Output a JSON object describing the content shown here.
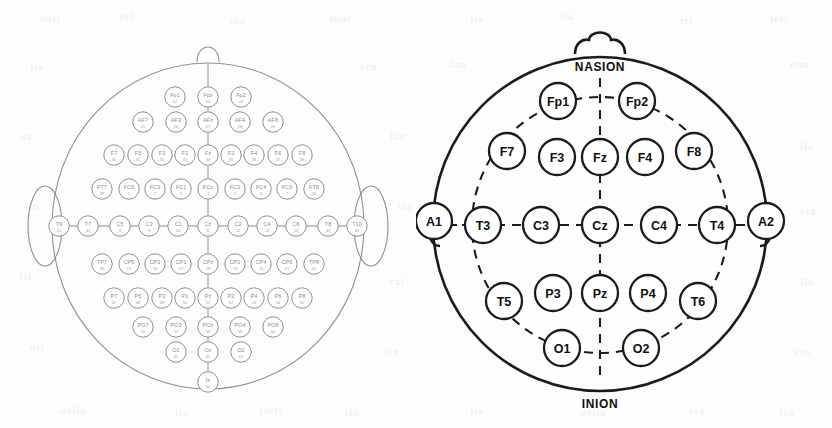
{
  "figure": {
    "background_color": "#fdfdfd",
    "hd_stroke_color": "#8d9095",
    "sd_stroke_color": "#1b1b1b"
  },
  "left_montage": {
    "name": "10-10 extended high-density EEG electrode map",
    "electrode_count": 64,
    "rows": [
      {
        "row_name": "Fp",
        "y": 97,
        "electrodes": [
          {
            "label": "Fp1",
            "num": "22",
            "x": 175
          },
          {
            "label": "Fpz",
            "num": "23",
            "x": 208
          },
          {
            "label": "Fp2",
            "num": "24",
            "x": 241
          }
        ]
      },
      {
        "row_name": "AF",
        "y": 122,
        "electrodes": [
          {
            "label": "AF7",
            "num": "25",
            "x": 143
          },
          {
            "label": "AF3",
            "num": "26",
            "x": 176
          },
          {
            "label": "AFz",
            "num": "27",
            "x": 208
          },
          {
            "label": "AF4",
            "num": "28",
            "x": 240
          },
          {
            "label": "AF8",
            "num": "29",
            "x": 273
          }
        ]
      },
      {
        "row_name": "F",
        "y": 155,
        "electrodes": [
          {
            "label": "F7",
            "num": "30",
            "x": 114
          },
          {
            "label": "F5",
            "num": "31",
            "x": 138
          },
          {
            "label": "F3",
            "num": "32",
            "x": 162
          },
          {
            "label": "F1",
            "num": "33",
            "x": 185
          },
          {
            "label": "Fz",
            "num": "34",
            "x": 208
          },
          {
            "label": "F2",
            "num": "35",
            "x": 231
          },
          {
            "label": "F4",
            "num": "36",
            "x": 254
          },
          {
            "label": "F6",
            "num": "37",
            "x": 278
          },
          {
            "label": "F8",
            "num": "38",
            "x": 302
          }
        ]
      },
      {
        "row_name": "FC",
        "y": 189,
        "electrodes": [
          {
            "label": "FT7",
            "num": "39",
            "x": 102
          },
          {
            "label": "FC5",
            "num": "1",
            "x": 129
          },
          {
            "label": "FC3",
            "num": "2",
            "x": 155
          },
          {
            "label": "FC1",
            "num": "3",
            "x": 181
          },
          {
            "label": "FCz",
            "num": "4",
            "x": 208
          },
          {
            "label": "FC2",
            "num": "5",
            "x": 235
          },
          {
            "label": "FC4",
            "num": "6",
            "x": 261
          },
          {
            "label": "FC6",
            "num": "7",
            "x": 287
          },
          {
            "label": "FT8",
            "num": "40",
            "x": 314
          }
        ]
      },
      {
        "row_name": "C",
        "y": 226,
        "electrodes": [
          {
            "label": "T9",
            "num": "42",
            "x": 59
          },
          {
            "label": "T7",
            "num": "41",
            "x": 88
          },
          {
            "label": "C5",
            "num": "8",
            "x": 120
          },
          {
            "label": "C3",
            "num": "9",
            "x": 149
          },
          {
            "label": "C1",
            "num": "10",
            "x": 178
          },
          {
            "label": "Cz",
            "num": "11",
            "x": 208
          },
          {
            "label": "C2",
            "num": "12",
            "x": 238
          },
          {
            "label": "C4",
            "num": "13",
            "x": 267
          },
          {
            "label": "C6",
            "num": "14",
            "x": 296
          },
          {
            "label": "T8",
            "num": "43",
            "x": 328
          },
          {
            "label": "T10",
            "num": "44",
            "x": 357
          }
        ]
      },
      {
        "row_name": "CP",
        "y": 264,
        "electrodes": [
          {
            "label": "TP7",
            "num": "46",
            "x": 102
          },
          {
            "label": "CP5",
            "num": "15",
            "x": 129
          },
          {
            "label": "CP3",
            "num": "16",
            "x": 155
          },
          {
            "label": "CP1",
            "num": "17",
            "x": 181
          },
          {
            "label": "CPz",
            "num": "18",
            "x": 208
          },
          {
            "label": "CP2",
            "num": "19",
            "x": 235
          },
          {
            "label": "CP4",
            "num": "20",
            "x": 261
          },
          {
            "label": "CP6",
            "num": "21",
            "x": 287
          },
          {
            "label": "TP8",
            "num": "45",
            "x": 314
          }
        ]
      },
      {
        "row_name": "P",
        "y": 298,
        "electrodes": [
          {
            "label": "P7",
            "num": "47",
            "x": 114
          },
          {
            "label": "P5",
            "num": "48",
            "x": 138
          },
          {
            "label": "P3",
            "num": "49",
            "x": 162
          },
          {
            "label": "P1",
            "num": "50",
            "x": 185
          },
          {
            "label": "Pz",
            "num": "51",
            "x": 208
          },
          {
            "label": "P2",
            "num": "52",
            "x": 231
          },
          {
            "label": "P4",
            "num": "53",
            "x": 254
          },
          {
            "label": "P6",
            "num": "54",
            "x": 278
          },
          {
            "label": "P8",
            "num": "55",
            "x": 302
          }
        ]
      },
      {
        "row_name": "PO",
        "y": 327,
        "electrodes": [
          {
            "label": "PO7",
            "num": "56",
            "x": 143
          },
          {
            "label": "PO3",
            "num": "57",
            "x": 176
          },
          {
            "label": "POz",
            "num": "58",
            "x": 208
          },
          {
            "label": "PO4",
            "num": "59",
            "x": 240
          },
          {
            "label": "PO8",
            "num": "60",
            "x": 273
          }
        ]
      },
      {
        "row_name": "O",
        "y": 352,
        "electrodes": [
          {
            "label": "O1",
            "num": "61",
            "x": 176
          },
          {
            "label": "Oz",
            "num": "62",
            "x": 208
          },
          {
            "label": "O2",
            "num": "63",
            "x": 241
          }
        ]
      },
      {
        "row_name": "I",
        "y": 382,
        "electrodes": [
          {
            "label": "Iz",
            "num": "64",
            "x": 208
          }
        ]
      }
    ]
  },
  "right_montage": {
    "name": "International 10-20 EEG electrode placement",
    "nasion_label": "NASION",
    "inion_label": "INION",
    "electrodes": [
      {
        "label": "Fp1",
        "x": 558,
        "y": 101
      },
      {
        "label": "Fp2",
        "x": 637,
        "y": 101
      },
      {
        "label": "F7",
        "x": 507,
        "y": 151
      },
      {
        "label": "F3",
        "x": 557,
        "y": 157
      },
      {
        "label": "Fz",
        "x": 600,
        "y": 157
      },
      {
        "label": "F4",
        "x": 645,
        "y": 157
      },
      {
        "label": "F8",
        "x": 694,
        "y": 151
      },
      {
        "label": "A1",
        "x": 434,
        "y": 221
      },
      {
        "label": "T3",
        "x": 483,
        "y": 225
      },
      {
        "label": "C3",
        "x": 541,
        "y": 225
      },
      {
        "label": "Cz",
        "x": 600,
        "y": 225
      },
      {
        "label": "C4",
        "x": 659,
        "y": 225
      },
      {
        "label": "T4",
        "x": 717,
        "y": 225
      },
      {
        "label": "A2",
        "x": 766,
        "y": 221
      },
      {
        "label": "T5",
        "x": 504,
        "y": 301
      },
      {
        "label": "P3",
        "x": 553,
        "y": 293
      },
      {
        "label": "Pz",
        "x": 600,
        "y": 293
      },
      {
        "label": "P4",
        "x": 648,
        "y": 293
      },
      {
        "label": "T6",
        "x": 698,
        "y": 301
      },
      {
        "label": "O1",
        "x": 562,
        "y": 348
      },
      {
        "label": "O2",
        "x": 641,
        "y": 348
      }
    ]
  },
  "scan_artifacts": [
    {
      "text": "dell",
      "x": 40,
      "y": 12
    },
    {
      "text": "ell",
      "x": 120,
      "y": 10
    },
    {
      "text": "the",
      "x": 230,
      "y": 14
    },
    {
      "text": "tour",
      "x": 330,
      "y": 12
    },
    {
      "text": "lla",
      "x": 470,
      "y": 12
    },
    {
      "text": "lla",
      "x": 560,
      "y": 10
    },
    {
      "text": "rrr",
      "x": 680,
      "y": 14
    },
    {
      "text": "lell",
      "x": 770,
      "y": 12
    },
    {
      "text": "lla",
      "x": 30,
      "y": 60
    },
    {
      "text": "ern",
      "x": 360,
      "y": 60
    },
    {
      "text": "lan",
      "x": 450,
      "y": 58
    },
    {
      "text": "nua",
      "x": 790,
      "y": 58
    },
    {
      "text": "ua",
      "x": 20,
      "y": 130
    },
    {
      "text": "lan",
      "x": 390,
      "y": 130
    },
    {
      "text": "lla",
      "x": 800,
      "y": 140
    },
    {
      "text": "llo",
      "x": 25,
      "y": 200
    },
    {
      "text": "lla",
      "x": 398,
      "y": 200
    },
    {
      "text": "era",
      "x": 800,
      "y": 205
    },
    {
      "text": "lll",
      "x": 20,
      "y": 270
    },
    {
      "text": "ral",
      "x": 390,
      "y": 275
    },
    {
      "text": "lla",
      "x": 800,
      "y": 275
    },
    {
      "text": "ull",
      "x": 30,
      "y": 340
    },
    {
      "text": "lle",
      "x": 385,
      "y": 345
    },
    {
      "text": "rro",
      "x": 795,
      "y": 345
    },
    {
      "text": "della",
      "x": 60,
      "y": 404
    },
    {
      "text": "lla",
      "x": 175,
      "y": 406
    },
    {
      "text": "tutti",
      "x": 260,
      "y": 404
    },
    {
      "text": "llo",
      "x": 345,
      "y": 406
    },
    {
      "text": "lla",
      "x": 470,
      "y": 404
    },
    {
      "text": "nella",
      "x": 580,
      "y": 406
    },
    {
      "text": "rra",
      "x": 690,
      "y": 404
    },
    {
      "text": "llo",
      "x": 780,
      "y": 406
    }
  ]
}
